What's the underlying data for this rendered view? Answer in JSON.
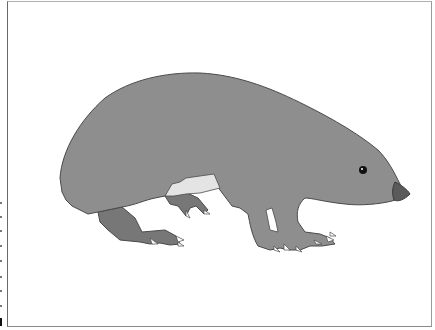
{
  "image": {
    "subject": "illustration of a mole-like animal (tenrec) walking right",
    "colors": {
      "background": "#ffffff",
      "body": "#8e8e8e",
      "hind_leg": "#777777",
      "belly_patch": "#e4e4e4",
      "outline": "#4a4a4a",
      "nose": "#5a5a5a",
      "eye": "#111111",
      "claws": "#ffffff",
      "frame": "#7a7a7a"
    }
  }
}
